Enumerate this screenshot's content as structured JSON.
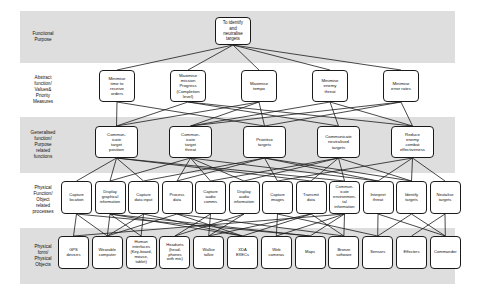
{
  "diagram": {
    "band_color": "#dedede",
    "node_border_color": "#1a1a1a",
    "edge_color": "#1a1a1a",
    "levels": [
      {
        "id": "functional-purpose",
        "label": "Functional\nPurpose"
      },
      {
        "id": "abstract-function",
        "label": "Abstract\nfunction/\nValues&\nPriority\nMeasures"
      },
      {
        "id": "generalised-function",
        "label": "Generalised\nfunction/\nPurpose\nrelated\nfunctions"
      },
      {
        "id": "physical-function",
        "label": "Physical\nFunction/\nObject\nrelated\nprocesses"
      },
      {
        "id": "physical-form",
        "label": "Physical\nform/\nPhysical\nObjects"
      }
    ],
    "rows": {
      "row1": [
        {
          "id": "fp-1",
          "label": "To identify\nand\nneutralise\ntargets"
        }
      ],
      "row2": [
        {
          "id": "af-1",
          "label": "Minimise\ntime to\nreceive\norders"
        },
        {
          "id": "af-2",
          "label": "Maximise\nmission\nProgress\n(Completion\nlevel)"
        },
        {
          "id": "af-3",
          "label": "Maximise\ntempo"
        },
        {
          "id": "af-4",
          "label": "Minimise\nenemy\nthreat"
        },
        {
          "id": "af-5",
          "label": "Minimise\nerror rates"
        }
      ],
      "row3": [
        {
          "id": "gf-1",
          "label": "Commun-\nicate\ntarget\nposition"
        },
        {
          "id": "gf-2",
          "label": "Commun-\nicate\ntarget\nthreat"
        },
        {
          "id": "gf-3",
          "label": "Prioritise\ntargets"
        },
        {
          "id": "gf-4",
          "label": "Communicate\nneutralised\ntargets"
        },
        {
          "id": "gf-5",
          "label": "Reduce\nenemy\ncombat\neffectiveness"
        }
      ],
      "row4": [
        {
          "id": "pf-1",
          "label": "Capture\nlocation"
        },
        {
          "id": "pf-2",
          "label": "Display\ngraphical\ninformation"
        },
        {
          "id": "pf-3",
          "label": "Capture\ndata input"
        },
        {
          "id": "pf-4",
          "label": "Process\ndata"
        },
        {
          "id": "pf-5",
          "label": "Capture\naudio\ncomms"
        },
        {
          "id": "pf-6",
          "label": "Display\naudio\ninformation"
        },
        {
          "id": "pf-7",
          "label": "Capture\nimages"
        },
        {
          "id": "pf-8",
          "label": "Transmit\ndata"
        },
        {
          "id": "pf-9",
          "label": "Commun-\nicate\nenvironmen-\ntal\ninformation"
        },
        {
          "id": "pf-10",
          "label": "Interpret\nthreat"
        },
        {
          "id": "pf-11",
          "label": "Identify\ntargets"
        },
        {
          "id": "pf-12",
          "label": "Neutalise\ntargets"
        }
      ],
      "row5": [
        {
          "id": "po-1",
          "label": "GPS\ndevices"
        },
        {
          "id": "po-2",
          "label": "Wearable\ncomputer"
        },
        {
          "id": "po-3",
          "label": "Human\ninterfaces\n(Key-board,\nmouse,\ntablet)"
        },
        {
          "id": "po-4",
          "label": "Headsets\n(head-\nphones\nwith mic)"
        },
        {
          "id": "po-5",
          "label": "Walkie\ntalkie"
        },
        {
          "id": "po-6",
          "label": "XDA\nEXECs"
        },
        {
          "id": "po-7",
          "label": "Web\ncameras"
        },
        {
          "id": "po-8",
          "label": "Maps"
        },
        {
          "id": "po-9",
          "label": "Bronze\nsoftware"
        },
        {
          "id": "po-10",
          "label": "Sensors"
        },
        {
          "id": "po-11",
          "label": "Effecters"
        },
        {
          "id": "po-12",
          "label": "Commander"
        }
      ]
    },
    "edges": [
      [
        "fp-1",
        "af-1"
      ],
      [
        "fp-1",
        "af-2"
      ],
      [
        "fp-1",
        "af-3"
      ],
      [
        "fp-1",
        "af-4"
      ],
      [
        "fp-1",
        "af-5"
      ],
      [
        "af-1",
        "gf-1"
      ],
      [
        "af-1",
        "gf-3"
      ],
      [
        "af-2",
        "gf-1"
      ],
      [
        "af-2",
        "gf-4"
      ],
      [
        "af-2",
        "gf-5"
      ],
      [
        "af-3",
        "gf-1"
      ],
      [
        "af-3",
        "gf-2"
      ],
      [
        "af-3",
        "gf-3"
      ],
      [
        "af-4",
        "gf-2"
      ],
      [
        "af-4",
        "gf-4"
      ],
      [
        "af-4",
        "gf-5"
      ],
      [
        "af-5",
        "gf-2"
      ],
      [
        "af-5",
        "gf-3"
      ],
      [
        "af-5",
        "gf-5"
      ],
      [
        "gf-1",
        "pf-1"
      ],
      [
        "gf-1",
        "pf-2"
      ],
      [
        "gf-1",
        "pf-3"
      ],
      [
        "gf-1",
        "pf-8"
      ],
      [
        "gf-1",
        "pf-9"
      ],
      [
        "gf-2",
        "pf-2"
      ],
      [
        "gf-2",
        "pf-4"
      ],
      [
        "gf-2",
        "pf-5"
      ],
      [
        "gf-2",
        "pf-6"
      ],
      [
        "gf-2",
        "pf-10"
      ],
      [
        "gf-3",
        "pf-3"
      ],
      [
        "gf-3",
        "pf-4"
      ],
      [
        "gf-3",
        "pf-7"
      ],
      [
        "gf-3",
        "pf-10"
      ],
      [
        "gf-3",
        "pf-11"
      ],
      [
        "gf-4",
        "pf-5"
      ],
      [
        "gf-4",
        "pf-6"
      ],
      [
        "gf-4",
        "pf-8"
      ],
      [
        "gf-4",
        "pf-9"
      ],
      [
        "gf-4",
        "pf-11"
      ],
      [
        "gf-5",
        "pf-7"
      ],
      [
        "gf-5",
        "pf-10"
      ],
      [
        "gf-5",
        "pf-11"
      ],
      [
        "gf-5",
        "pf-12"
      ],
      [
        "pf-1",
        "po-1"
      ],
      [
        "pf-1",
        "po-2"
      ],
      [
        "pf-1",
        "po-8"
      ],
      [
        "pf-2",
        "po-2"
      ],
      [
        "pf-2",
        "po-3"
      ],
      [
        "pf-2",
        "po-6"
      ],
      [
        "pf-2",
        "po-8"
      ],
      [
        "pf-3",
        "po-2"
      ],
      [
        "pf-3",
        "po-3"
      ],
      [
        "pf-3",
        "po-6"
      ],
      [
        "pf-4",
        "po-2"
      ],
      [
        "pf-4",
        "po-6"
      ],
      [
        "pf-4",
        "po-9"
      ],
      [
        "pf-5",
        "po-4"
      ],
      [
        "pf-5",
        "po-5"
      ],
      [
        "pf-6",
        "po-4"
      ],
      [
        "pf-6",
        "po-5"
      ],
      [
        "pf-7",
        "po-7"
      ],
      [
        "pf-7",
        "po-10"
      ],
      [
        "pf-8",
        "po-5"
      ],
      [
        "pf-8",
        "po-6"
      ],
      [
        "pf-8",
        "po-9"
      ],
      [
        "pf-9",
        "po-1"
      ],
      [
        "pf-9",
        "po-7"
      ],
      [
        "pf-9",
        "po-8"
      ],
      [
        "pf-9",
        "po-9"
      ],
      [
        "pf-10",
        "po-10"
      ],
      [
        "pf-10",
        "po-12"
      ],
      [
        "pf-11",
        "po-10"
      ],
      [
        "pf-11",
        "po-12"
      ],
      [
        "pf-12",
        "po-11"
      ],
      [
        "pf-12",
        "po-12"
      ]
    ]
  }
}
